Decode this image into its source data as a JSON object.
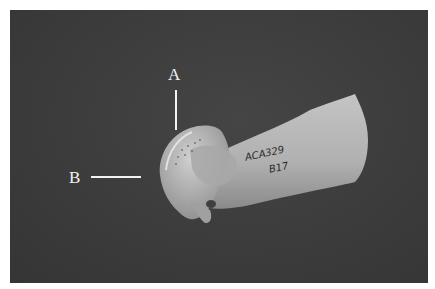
{
  "figure": {
    "labels": [
      {
        "id": "A",
        "text": "A",
        "pointer": "vertical"
      },
      {
        "id": "B",
        "text": "B",
        "pointer": "horizontal"
      }
    ],
    "specimen_text": {
      "line1": "ACA329",
      "line2": "B17"
    },
    "colors": {
      "background": "#3d3d3d",
      "bone": "#b8b8b8",
      "labels": "#f2f2f2",
      "frame": "#ffffff"
    }
  }
}
